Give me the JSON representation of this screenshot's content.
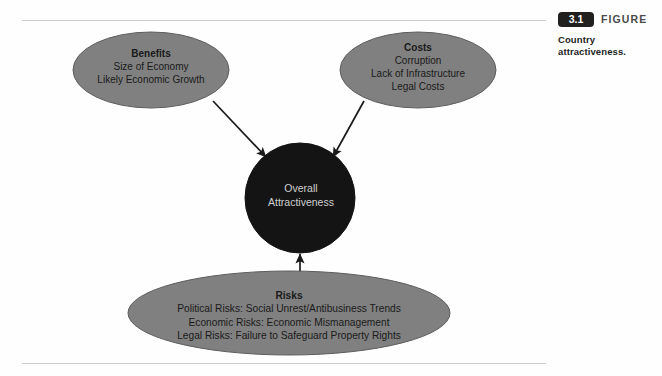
{
  "figure": {
    "number": "3.1",
    "label": "FIGURE",
    "caption": "Country attractiveness."
  },
  "diagram": {
    "type": "influence-diagram",
    "nodes": [
      {
        "id": "benefits",
        "shape": "ellipse",
        "title": "Benefits",
        "lines": [
          "Size of Economy",
          "Likely Economic Growth"
        ],
        "fill": "#808080",
        "stroke": "#5a5a5a",
        "text_color": "#1a1a1a"
      },
      {
        "id": "costs",
        "shape": "ellipse",
        "title": "Costs",
        "lines": [
          "Corruption",
          "Lack of Infrastructure",
          "Legal Costs"
        ],
        "fill": "#808080",
        "stroke": "#5a5a5a",
        "text_color": "#1a1a1a"
      },
      {
        "id": "risks",
        "shape": "ellipse",
        "title": "Risks",
        "lines": [
          "Political Risks: Social Unrest/Antibusiness Trends",
          "Economic Risks: Economic Mismanagement",
          "Legal Risks: Failure to Safeguard Property Rights"
        ],
        "fill": "#808080",
        "stroke": "#5a5a5a",
        "text_color": "#1a1a1a"
      },
      {
        "id": "overall",
        "shape": "circle",
        "title": "",
        "lines": [
          "Overall",
          "Attractiveness"
        ],
        "fill": "#141414",
        "stroke": "#141414",
        "text_color": "#cfcfcf"
      }
    ],
    "edges": [
      {
        "id": "benefits-to-overall",
        "from": "benefits",
        "to": "overall",
        "arrow": "to"
      },
      {
        "id": "costs-to-overall",
        "from": "costs",
        "to": "overall",
        "arrow": "to"
      },
      {
        "id": "risks-to-overall",
        "from": "risks",
        "to": "overall",
        "arrow": "to"
      }
    ],
    "edge_color": "#1a1a1a"
  }
}
